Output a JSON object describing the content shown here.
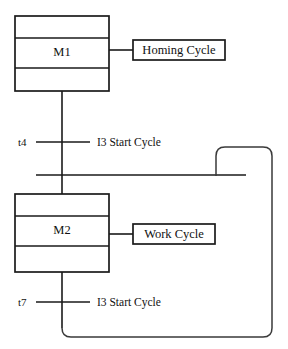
{
  "diagram": {
    "type": "sequential-function-chart",
    "title": "",
    "background_color": "#ffffff",
    "line_color": "#1a1a1a",
    "text_color": "#111111"
  },
  "steps": [
    {
      "id": "M1",
      "label": "M1",
      "x": 15,
      "y": 16,
      "width": 94,
      "height": 75,
      "divider_offsets": [
        22,
        52
      ],
      "action": {
        "label": "Homing Cycle",
        "x": 133,
        "y": 40,
        "width": 92,
        "height": 20
      }
    },
    {
      "id": "M2",
      "label": "M2",
      "x": 15,
      "y": 194,
      "width": 94,
      "height": 78,
      "divider_offsets": [
        22,
        52
      ],
      "action": {
        "label": "Work Cycle",
        "x": 133,
        "y": 224,
        "width": 82,
        "height": 20
      }
    }
  ],
  "transitions": [
    {
      "name": "t4",
      "condition": "I3  Start Cycle",
      "bar_y": 142,
      "bar_x1": 36,
      "bar_x2": 90,
      "name_x": 18,
      "cond_x": 97
    },
    {
      "name": "t7",
      "condition": "I3  Start Cycle",
      "bar_y": 302,
      "bar_x1": 36,
      "bar_x2": 90,
      "name_x": 18,
      "cond_x": 97
    }
  ],
  "rails": {
    "main_flow_x": 62,
    "convergence_bar": {
      "y": 175,
      "x1": 36,
      "x2": 246
    }
  },
  "feedback_loop": {
    "description": "return branch from below t7 back to convergence bar",
    "left_x": 216,
    "right_x": 272,
    "top_y": 147,
    "bottom_y": 337,
    "return_x": 62,
    "corner_radius": 9
  }
}
